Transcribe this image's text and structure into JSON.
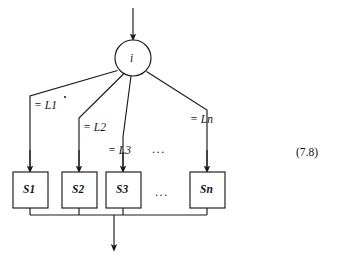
{
  "figure": {
    "kind": "flowchart-selection-construct",
    "equation_number": "(7.8)",
    "decision_node": {
      "label": "i",
      "shape": "circle",
      "cx": 133,
      "cy": 58,
      "r": 18
    },
    "input_arrow": {
      "name": "input-arrow",
      "x": 133,
      "y_from": 8,
      "y_to": 39
    },
    "branches": [
      {
        "id": "b1",
        "guard_label": "= L1",
        "guard_op": "=",
        "guard_value": "L1",
        "corner_x": 30,
        "corner_y": 96,
        "label_x": 34,
        "label_y": 100,
        "box": {
          "label": "S1",
          "name": "statement-box-s1",
          "x": 13,
          "y": 172,
          "w": 35,
          "h": 36,
          "cx": 30
        }
      },
      {
        "id": "b2",
        "guard_label": "= L2",
        "guard_op": "=",
        "guard_value": "L2",
        "corner_x": 79,
        "corner_y": 118,
        "label_x": 83,
        "label_y": 122,
        "box": {
          "label": "S2",
          "name": "statement-box-s2",
          "x": 62,
          "y": 172,
          "w": 35,
          "h": 36,
          "cx": 79
        }
      },
      {
        "id": "b3",
        "guard_label": "= L3",
        "guard_op": "=",
        "guard_value": "L3",
        "corner_x": 123,
        "corner_y": 137,
        "label_x": 108,
        "label_y": 145,
        "box": {
          "label": "S3",
          "name": "statement-box-s3",
          "x": 106,
          "y": 172,
          "w": 35,
          "h": 36,
          "cx": 123
        }
      },
      {
        "id": "bn",
        "guard_label": "= Ln",
        "guard_op": "=",
        "guard_value": "Ln",
        "corner_x": 207,
        "corner_y": 110,
        "label_x": 190,
        "label_y": 114,
        "box": {
          "label": "Sn",
          "name": "statement-box-sn",
          "x": 190,
          "y": 172,
          "w": 35,
          "h": 36,
          "cx": 207
        }
      }
    ],
    "ellipsis_guard": {
      "text": "...",
      "x": 152,
      "y": 143
    },
    "ellipsis_boxes": {
      "text": "...",
      "x": 155,
      "y": 188
    },
    "merge_bar": {
      "name": "merge-bar",
      "y": 215,
      "x_from": 30,
      "x_to": 207
    },
    "output_arrow": {
      "name": "output-arrow",
      "x": 114,
      "y_from": 215,
      "y_to": 251
    },
    "colors": {
      "stroke": "#1a1a1a",
      "background": "#ffffff",
      "text": "#141414"
    },
    "stroke_width": 1.15
  }
}
